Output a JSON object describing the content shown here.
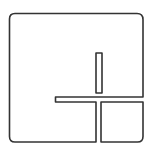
{
  "icon": {
    "name": "layout-split-icon",
    "label": "",
    "colors": {
      "background": "#ffffff",
      "stroke": "#333333"
    },
    "stroke_width": 1.6,
    "shapes": {
      "main_region": "M15 13.5 H137 Q143 13.5 143 19.5 V97 H55.5 V102 H96 V142 H15 Q9.5 142 9.5 136.5 V19 Q9.5 13.5 15 13.5 Z",
      "slot": "M96 53 H102 V93 H96 Z",
      "corner_square": "M101 102 H143 V136.5 Q143 142 137.5 142 H101 Z"
    }
  }
}
